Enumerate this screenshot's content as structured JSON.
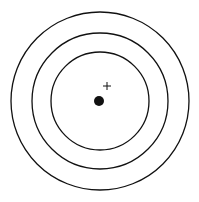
{
  "diagram": {
    "type": "concentric-circles",
    "background": "#ffffff",
    "stroke_color": "#111111",
    "center": {
      "x": 100,
      "y": 101
    },
    "circles": [
      {
        "name": "outer",
        "r": 89
      },
      {
        "name": "middle",
        "r": 68
      },
      {
        "name": "inner",
        "r": 49
      }
    ],
    "dot": {
      "x": 99,
      "y": 101,
      "r": 5,
      "color": "#111111"
    },
    "plus_marker": {
      "x": 107,
      "y": 86,
      "arm": 4
    }
  }
}
